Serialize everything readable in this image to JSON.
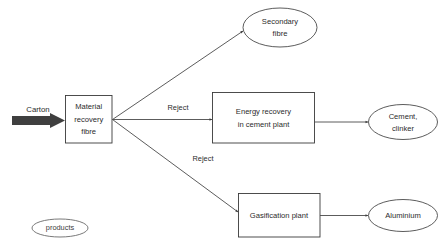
{
  "diagram": {
    "background_color": "#ffffff",
    "line_color": "#4a4a4a",
    "text_color": "#2b2b2b",
    "input": {
      "label": "Carton",
      "arrow_color": "#3f3f3f",
      "arrow_style": "thick-solid"
    },
    "process_boxes": [
      {
        "id": "mrf",
        "line1": "Material",
        "line2": "recovery",
        "line3": "fibre"
      },
      {
        "id": "energy-recovery",
        "line1": "Energy recovery",
        "line2": "in cement plant"
      },
      {
        "id": "gasification",
        "line1": "Gasification plant"
      }
    ],
    "output_ellipses": [
      {
        "id": "secondary-fibre",
        "line1": "Secondary",
        "line2": "fibre"
      },
      {
        "id": "cement-clinker",
        "line1": "Cement,",
        "line2": "clinker"
      },
      {
        "id": "aluminium",
        "line1": "Aluminium"
      }
    ],
    "edge_labels": {
      "reject_upper": "Reject",
      "reject_lower": "Reject"
    },
    "legend": {
      "products_label": "products"
    }
  }
}
